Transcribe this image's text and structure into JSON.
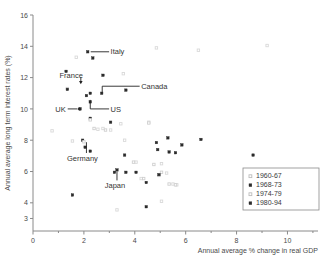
{
  "chart_data": {
    "type": "scatter",
    "title": "",
    "xlabel": "Annual average % change in real GDP",
    "ylabel": "Annual average long term interest rates (%)",
    "xlim": [
      0,
      11.2
    ],
    "ylim": [
      2.2,
      16
    ],
    "grid": false,
    "legend_position": "bottom-right",
    "xticks": [
      0,
      2,
      4,
      6,
      8,
      10
    ],
    "xtick_labels": [
      "0",
      "2",
      "4",
      "6",
      "8",
      "10"
    ],
    "x_minor_ticks": [
      1,
      3,
      5,
      7,
      9,
      11
    ],
    "yticks": [
      16,
      14,
      12,
      10,
      8,
      6,
      4,
      3
    ],
    "ytick_labels": [
      "16",
      "14",
      "12",
      "10",
      "8",
      "6",
      "4",
      "3"
    ],
    "series": [
      {
        "name": "1960-67",
        "marker": "open-square",
        "color": "#d9d9d9",
        "points": [
          [
            1.7,
            13.3
          ],
          [
            0.75,
            8.6
          ],
          [
            1.55,
            7.95
          ],
          [
            2.25,
            9.35
          ],
          [
            2.55,
            8.7
          ],
          [
            2.75,
            8.75
          ],
          [
            3.05,
            8.65
          ],
          [
            3.45,
            9.05
          ],
          [
            3.55,
            12.25
          ],
          [
            3.6,
            8.0
          ],
          [
            4.05,
            6.6
          ],
          [
            4.25,
            5.55
          ],
          [
            4.55,
            9.15
          ],
          [
            4.85,
            13.9
          ],
          [
            5.05,
            6.5
          ],
          [
            5.25,
            5.9
          ],
          [
            5.5,
            5.2
          ],
          [
            5.65,
            5.15
          ],
          [
            5.05,
            4.1
          ],
          [
            3.3,
            3.55
          ],
          [
            6.5,
            13.75
          ],
          [
            9.2,
            14.05
          ],
          [
            2.05,
            7.6
          ],
          [
            1.35,
            11.3
          ]
        ]
      },
      {
        "name": "1968-73",
        "marker": "filled-square",
        "color": "#2b2b2b",
        "points": [
          [
            2.15,
            13.65
          ],
          [
            2.35,
            13.25
          ],
          [
            1.3,
            12.4
          ],
          [
            2.75,
            12.15
          ],
          [
            1.35,
            11.25
          ],
          [
            2.25,
            11.0
          ],
          [
            2.7,
            11.0
          ],
          [
            3.65,
            11.2
          ],
          [
            2.1,
            10.85
          ],
          [
            2.25,
            10.45
          ],
          [
            1.85,
            10.0
          ],
          [
            2.25,
            9.4
          ],
          [
            3.05,
            9.15
          ],
          [
            1.95,
            8.0
          ],
          [
            2.05,
            7.55
          ],
          [
            2.25,
            7.3
          ],
          [
            3.6,
            7.05
          ],
          [
            1.55,
            4.5
          ],
          [
            3.2,
            5.95
          ],
          [
            3.3,
            6.1
          ]
        ]
      },
      {
        "name": "1974-79",
        "marker": "open-square",
        "color": "#cfcfcf",
        "points": [
          [
            2.25,
            9.3
          ],
          [
            2.85,
            8.65
          ],
          [
            2.0,
            7.9
          ],
          [
            4.35,
            5.55
          ],
          [
            4.95,
            5.75
          ],
          [
            5.35,
            5.2
          ],
          [
            5.6,
            5.15
          ],
          [
            2.4,
            8.75
          ],
          [
            4.75,
            6.45
          ],
          [
            5.05,
            5.95
          ],
          [
            4.55,
            9.1
          ],
          [
            3.95,
            6.6
          ]
        ]
      },
      {
        "name": "1980-94",
        "marker": "filled-square",
        "color": "#2b2b2b",
        "points": [
          [
            3.65,
            5.95
          ],
          [
            4.05,
            5.95
          ],
          [
            4.45,
            5.3
          ],
          [
            4.45,
            3.75
          ],
          [
            4.85,
            7.85
          ],
          [
            4.9,
            7.4
          ],
          [
            5.3,
            8.15
          ],
          [
            5.35,
            7.25
          ],
          [
            5.6,
            7.2
          ],
          [
            5.85,
            7.7
          ],
          [
            6.6,
            8.05
          ],
          [
            8.65,
            7.05
          ],
          [
            4.95,
            5.8
          ]
        ]
      }
    ],
    "annotations": [
      {
        "label": "Italy",
        "point_x": 2.15,
        "point_y": 13.65,
        "label_x": 3.05,
        "label_y": 13.65,
        "leader": "horizontal"
      },
      {
        "label": "France",
        "point_x": 1.88,
        "point_y": 11.45,
        "label_x": 2.35,
        "label_y": 12.15,
        "leader": "arrow-down"
      },
      {
        "label": "Canada",
        "point_x": 2.72,
        "point_y": 11.0,
        "label_x": 4.25,
        "label_y": 11.45,
        "leader": "elbow-right"
      },
      {
        "label": "UK",
        "point_x": 1.85,
        "point_y": 10.0,
        "label_x": 1.05,
        "label_y": 10.0,
        "leader": "horizontal-left"
      },
      {
        "label": "US",
        "point_x": 2.25,
        "point_y": 10.0,
        "label_x": 3.05,
        "label_y": 10.0,
        "leader": "elbow-left"
      },
      {
        "label": "Germany",
        "point_x": 2.1,
        "point_y": 8.0,
        "label_x": 1.65,
        "label_y": 6.8,
        "leader": "vertical"
      },
      {
        "label": "Japan",
        "point_x": 3.3,
        "point_y": 6.1,
        "label_x": 2.95,
        "label_y": 5.05,
        "leader": "vertical"
      }
    ]
  }
}
